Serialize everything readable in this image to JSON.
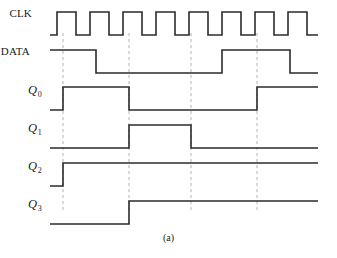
{
  "figure": {
    "caption": "(a)",
    "width": 337,
    "height": 258,
    "background": "#ffffff",
    "trace_color": "#2b2b2b",
    "dash_color": "#b3b3b3",
    "trace_width": 1.6,
    "dash_width": 1.0
  },
  "axis": {
    "x_start": 50,
    "x_end": 318,
    "clock_period": 66,
    "clock_edges": [
      57,
      63,
      90,
      96,
      123,
      129,
      156,
      162,
      189,
      191,
      218,
      224,
      251,
      257,
      284,
      290
    ]
  },
  "markers": {
    "label": "clock-edge-markers",
    "x_positions": [
      63,
      129,
      191,
      257
    ],
    "y_top": 33,
    "y_bottom": 212,
    "style": "dashed"
  },
  "signals": [
    {
      "name": "CLK",
      "label": "CLK",
      "label_style": "plain",
      "label_x": 18,
      "label_y": 14,
      "y_high": 12,
      "y_low": 35,
      "initial_level": "low",
      "transitions": [
        {
          "x": 57,
          "to": "high"
        },
        {
          "x": 76,
          "to": "low"
        },
        {
          "x": 90,
          "to": "high"
        },
        {
          "x": 109,
          "to": "low"
        },
        {
          "x": 123,
          "to": "high"
        },
        {
          "x": 142,
          "to": "low"
        },
        {
          "x": 156,
          "to": "high"
        },
        {
          "x": 175,
          "to": "low"
        },
        {
          "x": 189,
          "to": "high"
        },
        {
          "x": 208,
          "to": "low"
        },
        {
          "x": 222,
          "to": "high"
        },
        {
          "x": 241,
          "to": "low"
        },
        {
          "x": 255,
          "to": "high"
        },
        {
          "x": 274,
          "to": "low"
        },
        {
          "x": 288,
          "to": "high"
        },
        {
          "x": 307,
          "to": "low"
        }
      ]
    },
    {
      "name": "DATA",
      "label": "DATA",
      "label_style": "plain",
      "label_x": 16,
      "label_y": 52,
      "y_high": 50,
      "y_low": 73,
      "initial_level": "high",
      "transitions": [
        {
          "x": 96,
          "to": "low"
        },
        {
          "x": 222,
          "to": "high"
        },
        {
          "x": 290,
          "to": "low"
        }
      ]
    },
    {
      "name": "Q0",
      "label": "Q",
      "subscript": "0",
      "label_style": "italic",
      "label_x": 28,
      "label_y": 90,
      "y_high": 87,
      "y_low": 110,
      "initial_level": "low",
      "transitions": [
        {
          "x": 63,
          "to": "high"
        },
        {
          "x": 129,
          "to": "low"
        },
        {
          "x": 257,
          "to": "high"
        }
      ]
    },
    {
      "name": "Q1",
      "label": "Q",
      "subscript": "1",
      "label_style": "italic",
      "label_x": 28,
      "label_y": 128,
      "y_high": 125,
      "y_low": 148,
      "initial_level": "low",
      "transitions": [
        {
          "x": 129,
          "to": "high"
        },
        {
          "x": 191,
          "to": "low"
        }
      ]
    },
    {
      "name": "Q2",
      "label": "Q",
      "subscript": "2",
      "label_style": "italic",
      "label_x": 28,
      "label_y": 166,
      "y_high": 163,
      "y_low": 186,
      "initial_level": "low",
      "transitions": [
        {
          "x": 63,
          "to": "high"
        }
      ]
    },
    {
      "name": "Q3",
      "label": "Q",
      "subscript": "3",
      "label_style": "italic",
      "label_x": 28,
      "label_y": 204,
      "y_high": 201,
      "y_low": 224,
      "initial_level": "low",
      "transitions": [
        {
          "x": 129,
          "to": "high"
        }
      ]
    }
  ]
}
